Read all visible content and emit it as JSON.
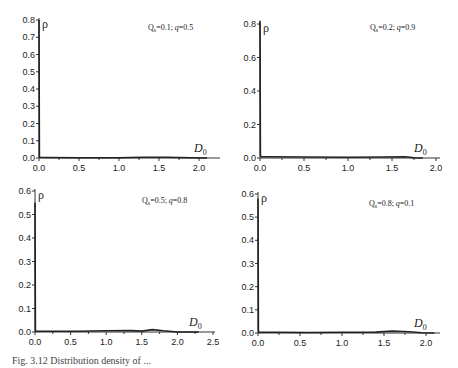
{
  "figure": {
    "caption": "Fig. 3.12  Distribution density of ..."
  },
  "chart_data": [
    {
      "type": "line",
      "panel": "top-left",
      "annotation": "Q_s=0.1; q=0.5",
      "xlabel": "D0",
      "ylabel": "ρ",
      "xlim": [
        0.0,
        2.2
      ],
      "ylim": [
        0.0,
        0.8
      ],
      "xticks": [
        "0.0",
        "0.5",
        "1.0",
        "1.5",
        "2.0"
      ],
      "yticks": [
        "0.0",
        "0.1",
        "0.2",
        "0.3",
        "0.4",
        "0.5",
        "0.6",
        "0.7",
        "0.8"
      ],
      "grid": false,
      "x": [
        0.0,
        0.005,
        0.01,
        0.1,
        0.5,
        1.0,
        1.3,
        1.6,
        1.9,
        2.1
      ],
      "y": [
        0.8,
        0.01,
        0.004,
        0.003,
        0.002,
        0.002,
        0.004,
        0.004,
        0.002,
        0.0
      ]
    },
    {
      "type": "line",
      "panel": "top-right",
      "annotation": "Q_s=0.2; q=0.9",
      "xlabel": "D0",
      "ylabel": "ρ",
      "xlim": [
        0.0,
        2.0
      ],
      "ylim": [
        0.0,
        0.8
      ],
      "xticks": [
        "0.0",
        "0.5",
        "1.0",
        "1.5",
        "2.0"
      ],
      "yticks": [
        "0.0",
        "0.2",
        "0.4",
        "0.6",
        "0.8"
      ],
      "grid": false,
      "x": [
        0.0,
        0.005,
        0.01,
        0.1,
        0.5,
        1.0,
        1.4,
        1.65,
        1.75,
        1.85
      ],
      "y": [
        0.82,
        0.02,
        0.008,
        0.007,
        0.006,
        0.005,
        0.006,
        0.008,
        0.002,
        0.0
      ]
    },
    {
      "type": "line",
      "panel": "bottom-left",
      "annotation": "Q_s=0.5; q=0.8",
      "xlabel": "D0",
      "ylabel": "ρ",
      "xlim": [
        0.0,
        2.5
      ],
      "ylim": [
        0.0,
        0.6
      ],
      "xticks": [
        "0.0",
        "0.5",
        "1.0",
        "1.5",
        "2.0",
        "2.5"
      ],
      "yticks": [
        "0.0",
        "0.1",
        "0.2",
        "0.3",
        "0.4",
        "0.5",
        "0.6"
      ],
      "grid": false,
      "x": [
        0.0,
        0.005,
        0.01,
        0.2,
        0.6,
        1.0,
        1.35,
        1.5,
        1.65,
        1.8,
        2.0,
        2.3
      ],
      "y": [
        0.55,
        0.01,
        0.004,
        0.003,
        0.003,
        0.005,
        0.006,
        0.004,
        0.01,
        0.005,
        0.0,
        0.0
      ]
    },
    {
      "type": "line",
      "panel": "bottom-right",
      "annotation": "Q_s=0.8; q=0.1",
      "xlabel": "D0",
      "ylabel": "ρ",
      "xlim": [
        0.0,
        2.1
      ],
      "ylim": [
        0.0,
        0.6
      ],
      "xticks": [
        "0.0",
        "0.5",
        "1.0",
        "1.5",
        "2.0"
      ],
      "yticks": [
        "0.0",
        "0.1",
        "0.2",
        "0.3",
        "0.4",
        "0.5",
        "0.6"
      ],
      "grid": false,
      "x": [
        0.0,
        0.005,
        0.01,
        0.2,
        0.6,
        1.0,
        1.4,
        1.6,
        1.8,
        1.95,
        2.1
      ],
      "y": [
        0.58,
        0.01,
        0.004,
        0.003,
        0.002,
        0.003,
        0.004,
        0.008,
        0.005,
        0.001,
        0.0
      ]
    }
  ]
}
